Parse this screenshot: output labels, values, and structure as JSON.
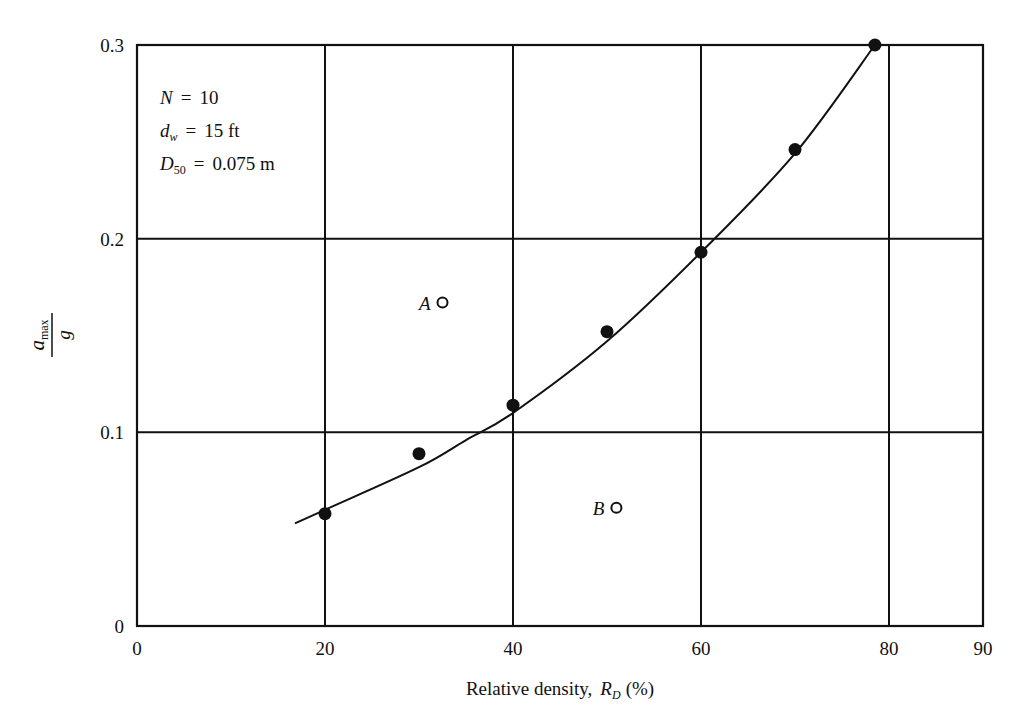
{
  "chart_data": {
    "type": "scatter",
    "title": "",
    "xlabel": "Relative density, R_D (%)",
    "xlabel_parts": {
      "main": "Relative density,",
      "var": "R",
      "sub": "D",
      "unit": "(%)"
    },
    "ylabel": "a_max / g",
    "ylabel_parts": {
      "num": "a",
      "num_sub": "max",
      "den": "g"
    },
    "xlim": [
      0,
      90
    ],
    "ylim": [
      0,
      0.3
    ],
    "grid": true,
    "x_ticks": [
      "0",
      "20",
      "40",
      "60",
      "80",
      "90"
    ],
    "y_ticks": [
      "0",
      "0.1",
      "0.2",
      "0.3"
    ],
    "annotations": [
      {
        "sym": "N",
        "sub": "",
        "eq": "=",
        "val": "10"
      },
      {
        "sym": "d",
        "sub": "w",
        "eq": "=",
        "val": "15 ft"
      },
      {
        "sym": "D",
        "sub": "50",
        "eq": "=",
        "val": "0.075 m"
      }
    ],
    "series": [
      {
        "name": "Test data (filled)",
        "marker": "filled-circle",
        "x": [
          20,
          30,
          40,
          50,
          60,
          70,
          78.5
        ],
        "y": [
          0.058,
          0.089,
          0.114,
          0.152,
          0.193,
          0.246,
          0.3
        ]
      },
      {
        "name": "Fitted curve",
        "marker": "line",
        "x": [
          16.8,
          20,
          30,
          35,
          40,
          50,
          60,
          70,
          78.5
        ],
        "y": [
          0.053,
          0.06,
          0.082,
          0.096,
          0.11,
          0.147,
          0.193,
          0.244,
          0.3
        ]
      },
      {
        "name": "Labeled points (open)",
        "marker": "open-circle",
        "points": [
          {
            "label": "A",
            "x": 32.5,
            "y": 0.167
          },
          {
            "label": "B",
            "x": 51,
            "y": 0.061
          }
        ]
      }
    ]
  }
}
